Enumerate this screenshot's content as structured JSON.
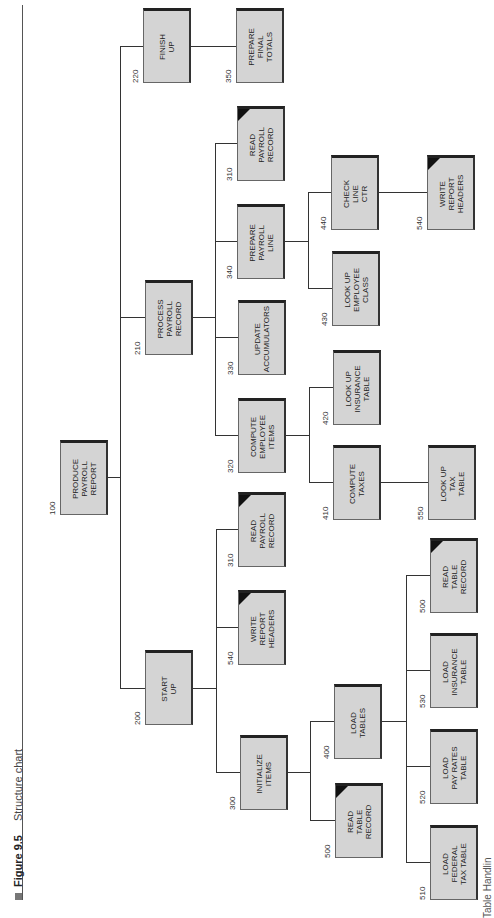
{
  "caption": {
    "figure": "Figure 9.5",
    "title": "Structure chart"
  },
  "footer": "Table Handlin",
  "nodes": [
    {
      "id": "100",
      "label": "PRODUCE\nPAYROLL\nREPORT",
      "x": 60,
      "y": 440,
      "corner": false
    },
    {
      "id": "200",
      "label": "START\nUP",
      "x": 145,
      "y": 650,
      "corner": false
    },
    {
      "id": "210",
      "label": "PROCESS\nPAYROLL\nRECORD",
      "x": 145,
      "y": 280,
      "corner": false
    },
    {
      "id": "220",
      "label": "FINISH\nUP",
      "x": 143,
      "y": 8,
      "corner": false
    },
    {
      "id": "300",
      "label": "INITIALIZE\nITEMS",
      "x": 240,
      "y": 735,
      "corner": false
    },
    {
      "id": "540",
      "label": "WRITE\nREPORT\nHEADERS",
      "x": 238,
      "y": 590,
      "corner": true
    },
    {
      "id": "310",
      "label": "READ\nPAYROLL\nRECORD",
      "x": 238,
      "y": 492,
      "corner": true
    },
    {
      "id": "320",
      "label": "COMPUTE\nEMPLOYEE\nITEMS",
      "x": 238,
      "y": 398,
      "corner": false
    },
    {
      "id": "330",
      "label": "UPDATE\nACCUMULATORS",
      "x": 238,
      "y": 300,
      "corner": false
    },
    {
      "id": "340",
      "label": "PREPARE\nPAYROLL\nLINE",
      "x": 237,
      "y": 204,
      "corner": false
    },
    {
      "id": "310",
      "label": "READ\nPAYROLL\nRECORD",
      "x": 237,
      "y": 106,
      "corner": true
    },
    {
      "id": "350",
      "label": "PREPARE\nFINAL\nTOTALS",
      "x": 236,
      "y": 8,
      "corner": false
    },
    {
      "id": "500",
      "label": "READ\nTABLE\nRECORD",
      "x": 335,
      "y": 783,
      "corner": true
    },
    {
      "id": "400",
      "label": "LOAD\nTABLES",
      "x": 334,
      "y": 684,
      "corner": false
    },
    {
      "id": "410",
      "label": "COMPUTE\nTAXES",
      "x": 333,
      "y": 445,
      "corner": false
    },
    {
      "id": "420",
      "label": "LOOK UP\nINSURANCE\nTABLE",
      "x": 333,
      "y": 350,
      "corner": false
    },
    {
      "id": "430",
      "label": "LOOK UP\nEMPLOYEE\nCLASS",
      "x": 332,
      "y": 251,
      "corner": false
    },
    {
      "id": "440",
      "label": "CHECK\nLINE\nCTR",
      "x": 331,
      "y": 155,
      "corner": false
    },
    {
      "id": "510",
      "label": "LOAD\nFEDERAL\nTAX TABLE",
      "x": 430,
      "y": 825,
      "corner": false
    },
    {
      "id": "520",
      "label": "LOAD\nPAY RATES\nTABLE",
      "x": 430,
      "y": 729,
      "corner": false
    },
    {
      "id": "530",
      "label": "LOAD\nINSURANCE\nTABLE",
      "x": 430,
      "y": 633,
      "corner": false
    },
    {
      "id": "500",
      "label": "READ\nTABLE\nRECORD",
      "x": 430,
      "y": 538,
      "corner": true
    },
    {
      "id": "550",
      "label": "LOOK UP\nTAX\nTABLE",
      "x": 428,
      "y": 445,
      "corner": false
    },
    {
      "id": "540",
      "label": "WRITE\nREPORT\nHEADERS",
      "x": 427,
      "y": 155,
      "corner": true
    }
  ]
}
